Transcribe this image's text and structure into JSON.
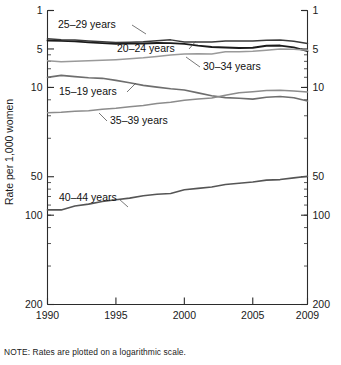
{
  "note": "NOTE: Rates are plotted on a logarithmic scale.",
  "axis": {
    "ylabel": "Rate per 1,000 women",
    "ytick_labels": [
      "200",
      "100",
      "50",
      "10",
      "5",
      "1"
    ],
    "xtick_labels": [
      "1990",
      "1995",
      "2000",
      "2005",
      "2009"
    ]
  },
  "annotations": [
    {
      "label": "25–29 years"
    },
    {
      "label": "20–24 years"
    },
    {
      "label": "30–34 years"
    },
    {
      "label": "15–19 years"
    },
    {
      "label": "35–39 years"
    },
    {
      "label": "40–44 years"
    }
  ],
  "chart_data": {
    "type": "line",
    "title": "",
    "xlabel": "",
    "ylabel": "Rate per 1,000 women",
    "xlim": [
      1990,
      2009
    ],
    "ylim": [
      1,
      200
    ],
    "yscale": "log",
    "grid": false,
    "legend_position": "inline-annotations",
    "yticks": [
      1,
      5,
      10,
      50,
      100,
      200
    ],
    "xticks": [
      1990,
      1995,
      2000,
      2005,
      2009
    ],
    "x": [
      1990,
      1991,
      1992,
      1993,
      1994,
      1995,
      1996,
      1997,
      1998,
      1999,
      2000,
      2001,
      2002,
      2003,
      2004,
      2005,
      2006,
      2007,
      2008,
      2009
    ],
    "series": [
      {
        "name": "15–19 years",
        "color": "#6e6e6e",
        "width": 1.6,
        "values": [
          59.9,
          62.1,
          60.7,
          59.6,
          58.9,
          56.8,
          54.4,
          51.9,
          50.3,
          48.8,
          47.7,
          45.3,
          43.0,
          41.6,
          41.1,
          40.5,
          41.9,
          42.5,
          41.5,
          39.1
        ]
      },
      {
        "name": "20–24 years",
        "color": "#1b1b1b",
        "width": 1.9,
        "values": [
          116.5,
          115.7,
          114.6,
          112.6,
          111.1,
          109.8,
          110.4,
          110.4,
          111.2,
          111.0,
          109.7,
          106.2,
          103.6,
          102.6,
          101.7,
          102.2,
          105.9,
          106.3,
          103.0,
          96.3
        ]
      },
      {
        "name": "25–29 years",
        "color": "#3a3a3a",
        "width": 1.5,
        "values": [
          120.2,
          118.2,
          117.4,
          115.5,
          113.9,
          112.2,
          113.1,
          113.8,
          115.9,
          117.8,
          113.5,
          113.4,
          113.6,
          115.6,
          115.5,
          115.5,
          116.8,
          117.5,
          115.1,
          110.5
        ]
      },
      {
        "name": "30–34 years",
        "color": "#9a9a9a",
        "width": 1.5,
        "values": [
          80.8,
          79.5,
          80.2,
          80.8,
          81.5,
          82.5,
          83.9,
          85.3,
          87.4,
          89.6,
          91.2,
          91.9,
          91.5,
          95.1,
          95.3,
          95.8,
          97.7,
          99.9,
          99.3,
          97.5
        ]
      },
      {
        "name": "35–39 years",
        "color": "#8c8c8c",
        "width": 1.5,
        "values": [
          31.7,
          32.0,
          32.5,
          32.9,
          33.7,
          34.3,
          35.3,
          36.1,
          37.4,
          38.3,
          39.7,
          40.6,
          41.4,
          43.4,
          45.4,
          46.3,
          47.3,
          47.5,
          46.9,
          46.1
        ]
      },
      {
        "name": "40–44 years",
        "color": "#555555",
        "width": 1.6,
        "values": [
          5.5,
          5.5,
          5.9,
          6.1,
          6.4,
          6.6,
          6.8,
          7.1,
          7.3,
          7.4,
          7.9,
          8.1,
          8.3,
          8.7,
          8.9,
          9.1,
          9.4,
          9.5,
          9.8,
          10.1
        ]
      }
    ]
  }
}
